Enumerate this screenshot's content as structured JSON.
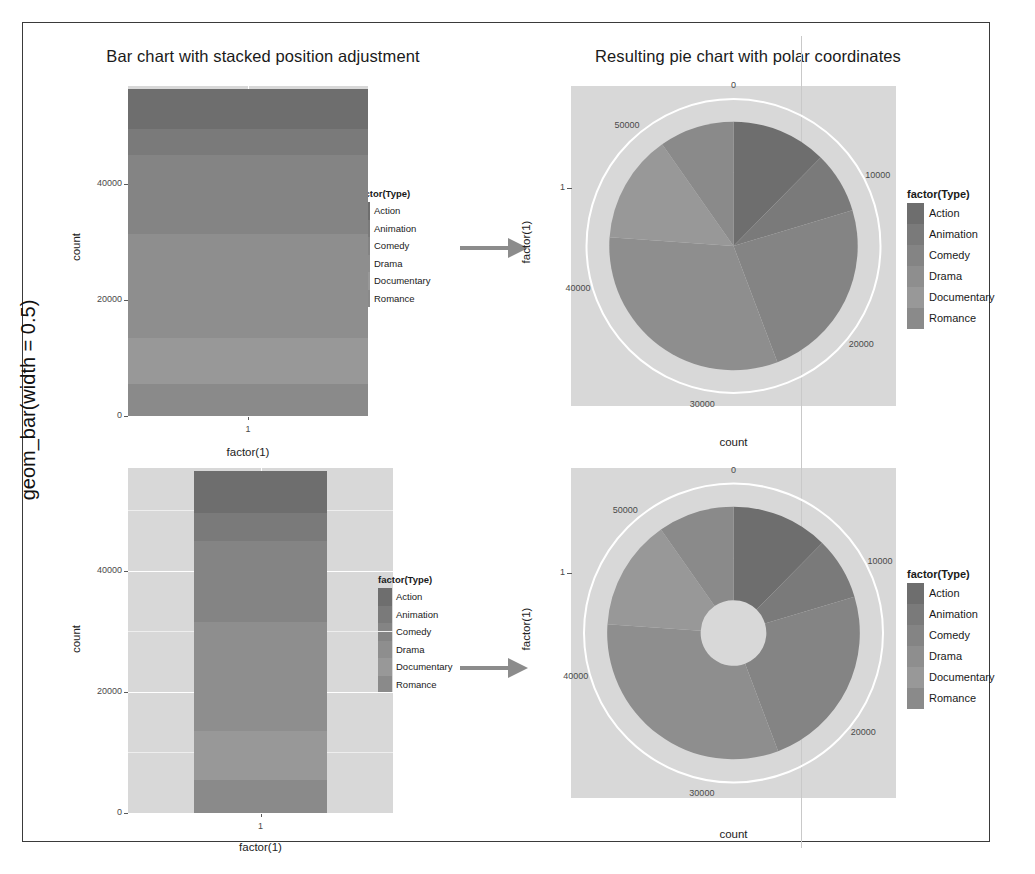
{
  "figure": {
    "row_label": "geom_bar(width = 0.5)",
    "titles": {
      "left": "Bar chart with stacked position adjustment",
      "right": "Resulting pie chart with polar coordinates"
    },
    "arrow_icon": "right-arrow-icon"
  },
  "legend": {
    "title": "factor(Type)",
    "items": [
      "Action",
      "Animation",
      "Comedy",
      "Drama",
      "Documentary",
      "Romance"
    ],
    "colors": [
      "#6e6e6e",
      "#7a7a7a",
      "#848484",
      "#8e8e8e",
      "#989898",
      "#8a8a8a"
    ]
  },
  "colors": {
    "panel_bg": "#d8d8d8",
    "grid_major": "#ffffff",
    "bar_fill": "#8a8a8a",
    "arrow": "#8c8c8c",
    "frame": "#3a3a3a",
    "text": "#1a1a1a",
    "tick_text": "#4a4a4a"
  },
  "chart_data": [
    {
      "id": "bar-top",
      "type": "bar",
      "title": "Bar chart with stacked position adjustment",
      "xlabel": "factor(1)",
      "ylabel": "count",
      "xticks": [
        "1"
      ],
      "yticks": [
        "0",
        "20000",
        "40000"
      ],
      "ylim": [
        0,
        57000
      ],
      "grid": true,
      "stacked": true,
      "bar_width_fraction": 1.0,
      "categories": [
        "1"
      ],
      "series": [
        {
          "name": "Action",
          "values": [
            7000
          ]
        },
        {
          "name": "Animation",
          "values": [
            4500
          ]
        },
        {
          "name": "Comedy",
          "values": [
            13500
          ]
        },
        {
          "name": "Drama",
          "values": [
            18000
          ]
        },
        {
          "name": "Documentary",
          "values": [
            8000
          ]
        },
        {
          "name": "Romance",
          "values": [
            5500
          ]
        }
      ],
      "total": 56500
    },
    {
      "id": "pie-top",
      "type": "pie",
      "title": "Resulting pie chart with polar coordinates",
      "xlabel": "count",
      "ylabel": "factor(1)",
      "yticks": [
        "1"
      ],
      "radial_ticks": [
        "0",
        "10000",
        "20000",
        "30000",
        "40000",
        "50000"
      ],
      "radial_max": 56500,
      "inner_radius_fraction": 0.0,
      "grid": true,
      "slices": [
        {
          "name": "Action",
          "value": 7000
        },
        {
          "name": "Animation",
          "value": 4500
        },
        {
          "name": "Comedy",
          "value": 13500
        },
        {
          "name": "Drama",
          "value": 18000
        },
        {
          "name": "Documentary",
          "value": 8000
        },
        {
          "name": "Romance",
          "value": 5500
        }
      ]
    },
    {
      "id": "bar-bottom",
      "type": "bar",
      "title": "Bar chart with stacked position adjustment",
      "xlabel": "factor(1)",
      "ylabel": "count",
      "xticks": [
        "1"
      ],
      "yticks": [
        "0",
        "20000",
        "40000"
      ],
      "ylim": [
        0,
        57000
      ],
      "grid": true,
      "stacked": true,
      "bar_width_fraction": 0.5,
      "categories": [
        "1"
      ],
      "series": [
        {
          "name": "Action",
          "values": [
            7000
          ]
        },
        {
          "name": "Animation",
          "values": [
            4500
          ]
        },
        {
          "name": "Comedy",
          "values": [
            13500
          ]
        },
        {
          "name": "Drama",
          "values": [
            18000
          ]
        },
        {
          "name": "Documentary",
          "values": [
            8000
          ]
        },
        {
          "name": "Romance",
          "values": [
            5500
          ]
        }
      ],
      "total": 56500
    },
    {
      "id": "donut-bottom",
      "type": "pie",
      "title": "Resulting pie chart with polar coordinates",
      "xlabel": "count",
      "ylabel": "factor(1)",
      "yticks": [
        "1"
      ],
      "radial_ticks": [
        "0",
        "10000",
        "20000",
        "30000",
        "40000",
        "50000"
      ],
      "radial_max": 56500,
      "inner_radius_fraction": 0.26,
      "grid": true,
      "slices": [
        {
          "name": "Action",
          "value": 7000
        },
        {
          "name": "Animation",
          "value": 4500
        },
        {
          "name": "Comedy",
          "value": 13500
        },
        {
          "name": "Drama",
          "value": 18000
        },
        {
          "name": "Documentary",
          "value": 8000
        },
        {
          "name": "Romance",
          "value": 5500
        }
      ]
    }
  ]
}
